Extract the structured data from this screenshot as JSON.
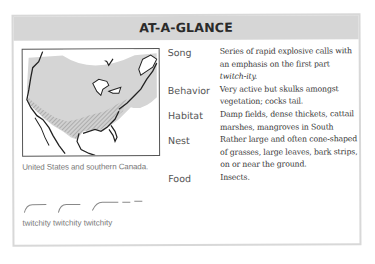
{
  "header": {
    "title": "AT-A-GLANCE"
  },
  "map": {
    "caption": "United States and southern Canada.",
    "range_fill_color": "#d5d5d5",
    "border_color": "#555555"
  },
  "song_graphic": {
    "label": "twitchity twitchity twitchity"
  },
  "facts": [
    {
      "label": "Song",
      "value_lines": [
        "Series of rapid explosive calls with",
        "an emphasis on the first part"
      ],
      "value_italic": "twitch-ity."
    },
    {
      "label": "Behavior",
      "value_lines": [
        "Very active but skulks amongst",
        "vegetation; cocks tail."
      ]
    },
    {
      "label": "Habitat",
      "value_lines": [
        "Damp fields, dense thickets, cattail",
        "marshes, mangroves in South"
      ]
    },
    {
      "label": "Nest",
      "value_lines": [
        "Rather large and often cone-shaped",
        "of grasses, large leaves, bark strips,",
        "on or near the ground."
      ]
    },
    {
      "label": "Food",
      "value_lines": [
        "Insects."
      ]
    }
  ]
}
